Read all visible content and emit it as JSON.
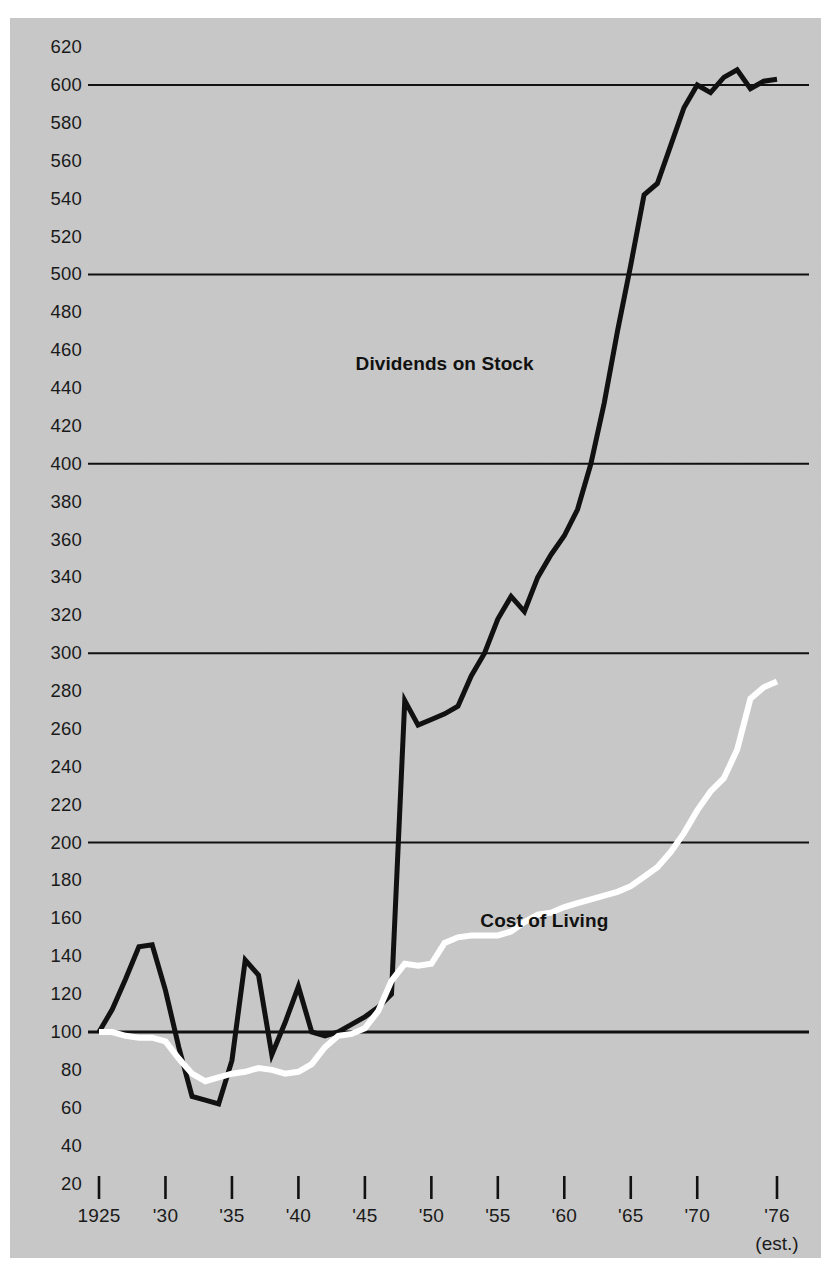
{
  "meta": {
    "background_color": "#c9c9c9",
    "ink_color": "#111111",
    "highlight_color": "#ffffff"
  },
  "chart_data": {
    "type": "line",
    "title": "",
    "subtitle": "",
    "xlabel": "",
    "ylabel": "",
    "grid": true,
    "gridlines": [
      100,
      200,
      300,
      400,
      500,
      600
    ],
    "legend_position": "inline-annotations",
    "xlim": [
      1925,
      1976
    ],
    "ylim": [
      20,
      620
    ],
    "y_ticks": [
      620,
      600,
      580,
      560,
      540,
      520,
      500,
      480,
      460,
      440,
      420,
      400,
      380,
      360,
      340,
      320,
      300,
      280,
      260,
      240,
      220,
      200,
      180,
      160,
      140,
      120,
      100,
      80,
      60,
      40,
      20
    ],
    "y_tick_labels": [
      "620",
      "600",
      "580",
      "560",
      "540",
      "520",
      "500",
      "480",
      "460",
      "440",
      "420",
      "400",
      "380",
      "360",
      "340",
      "320",
      "300",
      "280",
      "260",
      "240",
      "220",
      "200",
      "180",
      "160",
      "140",
      "120",
      "100",
      "80",
      "60",
      "40",
      "20"
    ],
    "x_ticks": [
      1925,
      1930,
      1935,
      1940,
      1945,
      1950,
      1955,
      1960,
      1965,
      1970,
      1976
    ],
    "x_tick_labels": [
      "1925",
      "'30",
      "'35",
      "'40",
      "'45",
      "'50",
      "'55",
      "'60",
      "'65",
      "'70",
      "'76"
    ],
    "x_tick_sublabel": "(est.)",
    "x_tick_sublabel_at": 1976,
    "annotations": [
      {
        "text": "Dividends on Stock",
        "x": 1951,
        "y": 452
      },
      {
        "text": "Cost of Living",
        "x": 1958.5,
        "y": 158
      }
    ],
    "series": [
      {
        "name": "Dividends on Stock",
        "color": "#111111",
        "line_width": 5,
        "x": [
          1925,
          1926,
          1927,
          1928,
          1929,
          1930,
          1931,
          1932,
          1933,
          1934,
          1935,
          1936,
          1937,
          1938,
          1939,
          1940,
          1941,
          1942,
          1943,
          1944,
          1945,
          1946,
          1947,
          1948,
          1949,
          1950,
          1951,
          1952,
          1953,
          1954,
          1955,
          1956,
          1957,
          1958,
          1959,
          1960,
          1961,
          1962,
          1963,
          1964,
          1965,
          1966,
          1967,
          1968,
          1969,
          1970,
          1971,
          1972,
          1973,
          1974,
          1975,
          1976
        ],
        "values": [
          100,
          112,
          128,
          145,
          146,
          122,
          92,
          66,
          64,
          62,
          85,
          138,
          130,
          88,
          105,
          124,
          100,
          98,
          100,
          104,
          108,
          113,
          120,
          275,
          262,
          265,
          268,
          272,
          288,
          300,
          318,
          330,
          322,
          340,
          352,
          362,
          376,
          400,
          432,
          470,
          505,
          542,
          548,
          568,
          588,
          600,
          596,
          604,
          608,
          598,
          602,
          603
        ]
      },
      {
        "name": "Cost of Living",
        "color": "#ffffff",
        "line_width": 6,
        "x": [
          1925,
          1926,
          1927,
          1928,
          1929,
          1930,
          1931,
          1932,
          1933,
          1934,
          1935,
          1936,
          1937,
          1938,
          1939,
          1940,
          1941,
          1942,
          1943,
          1944,
          1945,
          1946,
          1947,
          1948,
          1949,
          1950,
          1951,
          1952,
          1953,
          1954,
          1955,
          1956,
          1957,
          1958,
          1959,
          1960,
          1961,
          1962,
          1963,
          1964,
          1965,
          1966,
          1967,
          1968,
          1969,
          1970,
          1971,
          1972,
          1973,
          1974,
          1975,
          1976
        ],
        "values": [
          100,
          100,
          98,
          97,
          97,
          95,
          86,
          78,
          74,
          76,
          78,
          79,
          81,
          80,
          78,
          79,
          83,
          92,
          98,
          99,
          102,
          111,
          127,
          136,
          135,
          136,
          147,
          150,
          151,
          151,
          151,
          153,
          158,
          162,
          163,
          166,
          168,
          170,
          172,
          174,
          177,
          182,
          187,
          195,
          205,
          217,
          227,
          234,
          249,
          276,
          282,
          285
        ]
      }
    ]
  }
}
